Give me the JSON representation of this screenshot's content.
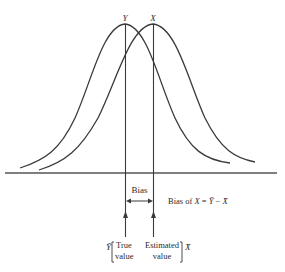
{
  "diagram": {
    "title": "",
    "curves": [
      {
        "name": "Y",
        "peak_label": "Y",
        "peak_x": 125
      },
      {
        "name": "X",
        "peak_label": "X",
        "peak_x": 153
      }
    ],
    "bias_label": "Bias",
    "bias_formula": {
      "prefix": "Bias of ",
      "var": "X",
      "eq": " = ",
      "ybar": "Ȳ",
      "minus": " − ",
      "xbar": "X̄"
    },
    "true_marker": {
      "symbol": "Ȳ",
      "line1": "True",
      "line2": "value"
    },
    "estimated_marker": {
      "symbol": "X̄",
      "line1": "Estimated",
      "line2": "value"
    },
    "colors": {
      "stroke": "#3a3a3a",
      "text": "#2a2a2a",
      "baseline": "#555555"
    }
  }
}
